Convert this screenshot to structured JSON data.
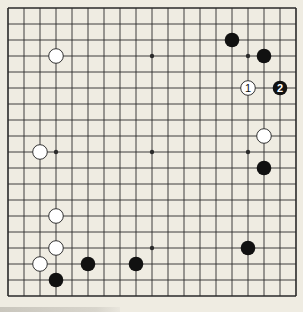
{
  "board": {
    "size": 19,
    "origin": [
      8,
      8
    ],
    "spacing": 16,
    "colors": {
      "background": "#efece2",
      "line": "#2a2a2a",
      "black_stone": "#111111",
      "white_stone": "#ffffff",
      "white_stone_border": "#333333"
    },
    "star_points": [
      [
        3,
        3
      ],
      [
        9,
        3
      ],
      [
        15,
        3
      ],
      [
        3,
        9
      ],
      [
        9,
        9
      ],
      [
        15,
        9
      ],
      [
        3,
        15
      ],
      [
        9,
        15
      ],
      [
        15,
        15
      ]
    ],
    "stones": [
      {
        "color": "white",
        "col": 3,
        "row": 3,
        "label": ""
      },
      {
        "color": "black",
        "col": 14,
        "row": 2,
        "label": ""
      },
      {
        "color": "black",
        "col": 16,
        "row": 3,
        "label": ""
      },
      {
        "color": "white",
        "col": 15,
        "row": 5,
        "label": "1"
      },
      {
        "color": "black",
        "col": 17,
        "row": 5,
        "label": "2"
      },
      {
        "color": "white",
        "col": 16,
        "row": 8,
        "label": ""
      },
      {
        "color": "black",
        "col": 16,
        "row": 10,
        "label": ""
      },
      {
        "color": "white",
        "col": 2,
        "row": 9,
        "label": ""
      },
      {
        "color": "white",
        "col": 3,
        "row": 13,
        "label": ""
      },
      {
        "color": "white",
        "col": 3,
        "row": 15,
        "label": ""
      },
      {
        "color": "white",
        "col": 2,
        "row": 16,
        "label": ""
      },
      {
        "color": "black",
        "col": 3,
        "row": 17,
        "label": ""
      },
      {
        "color": "black",
        "col": 5,
        "row": 16,
        "label": ""
      },
      {
        "color": "black",
        "col": 8,
        "row": 16,
        "label": ""
      },
      {
        "color": "black",
        "col": 15,
        "row": 15,
        "label": ""
      }
    ]
  }
}
